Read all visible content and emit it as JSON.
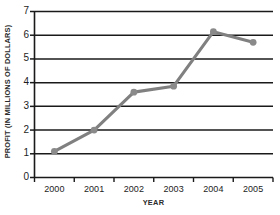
{
  "chart_data": {
    "type": "line",
    "title": "",
    "xlabel": "YEAR",
    "ylabel": "PROFIT (IN MILLIONS OF DOLLARS)",
    "categories": [
      "2000",
      "2001",
      "2002",
      "2003",
      "2004",
      "2005"
    ],
    "values": [
      1.1,
      2.0,
      3.6,
      3.85,
      6.15,
      5.7
    ],
    "series": [
      {
        "name": "Profit",
        "values": [
          1.1,
          2.0,
          3.6,
          3.85,
          6.15,
          5.7
        ]
      }
    ],
    "ylim": [
      0,
      7
    ],
    "yticks": [
      0,
      1,
      2,
      3,
      4,
      5,
      6,
      7
    ],
    "ytick_labels": [
      "0",
      "1",
      "2",
      "3",
      "4",
      "5",
      "6",
      "7"
    ],
    "xtick_labels": [
      "2000",
      "2001",
      "2002",
      "2003",
      "2004",
      "2005"
    ],
    "grid": true,
    "grid_axis": "y",
    "legend": false,
    "legend_position": "none",
    "markers": true,
    "colors": {
      "line": "#808080",
      "marker": "#8a8a8a",
      "grid": "#1a1a1a",
      "axis": "#1a1a1a",
      "text": "#1d1d1d",
      "background": "#ffffff"
    }
  }
}
